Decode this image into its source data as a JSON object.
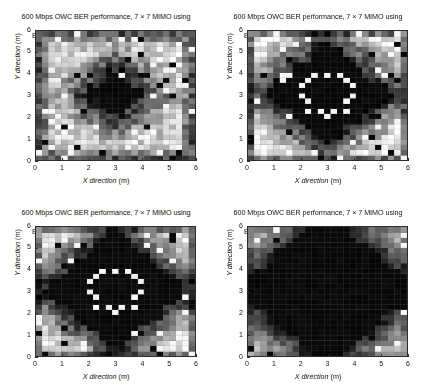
{
  "figure": {
    "background": "#ffffff",
    "layout": "2x2 subplot grid",
    "axis_color": "#2b2b2b"
  },
  "axes_common": {
    "xlabel_text": "X direction",
    "xlabel_unit": " (m)",
    "ylabel_text": "Y direction",
    "ylabel_unit": " (m)",
    "xticks": [
      "0",
      "1",
      "2",
      "3",
      "4",
      "5",
      "6"
    ],
    "yticks": [
      "0",
      "1",
      "2",
      "3",
      "4",
      "5",
      "6"
    ],
    "xlim": [
      0,
      6
    ],
    "ylim": [
      0,
      6
    ],
    "grid": true,
    "colormap": "gray"
  },
  "panels": [
    {
      "id": "panel-top-left",
      "title_line1": "600 Mbps OWC BER performance, 7 × 7 MIMO using",
      "title_line2": "EGC (−87 dBmW noise), BER outage: 0.87515",
      "noise_dbmw": -87,
      "ber_outage": 0.87515,
      "combining": "EGC",
      "mimo": "7 × 7",
      "data_rate": "600 Mbps"
    },
    {
      "id": "panel-top-right",
      "title_line1": "600 Mbps OWC BER performance, 7 × 7 MIMO using",
      "title_line2": "EGC (−90 dBmW noise), BER outage: 0.53746",
      "noise_dbmw": -90,
      "ber_outage": 0.53746,
      "combining": "EGC",
      "mimo": "7 × 7",
      "data_rate": "600 Mbps"
    },
    {
      "id": "panel-bottom-left",
      "title_line1": "600 Mbps OWC BER performance, 7 × 7 MIMO using",
      "title_line2": "EGC (−93 dBmW noise), BER outage: 0.46136",
      "noise_dbmw": -93,
      "ber_outage": 0.46136,
      "combining": "EGC",
      "mimo": "7 × 7",
      "data_rate": "600 Mbps"
    },
    {
      "id": "panel-bottom-right",
      "title_line1": "600 Mbps OWC BER performance, 7 × 7 MIMO using",
      "title_line2": "EGC (−96 dBmW noise), BER outage: 0.24732",
      "noise_dbmw": -96,
      "ber_outage": 0.24732,
      "combining": "EGC",
      "mimo": "7 × 7",
      "data_rate": "600 Mbps"
    }
  ],
  "chart_data": [
    {
      "type": "heatmap",
      "panel": "panel-top-left",
      "title": "600 Mbps OWC BER performance, 7 × 7 MIMO using EGC (−87 dBmW noise), BER outage: 0.87515",
      "xlabel": "X direction (m)",
      "ylabel": "Y direction (m)",
      "xlim": [
        0,
        6
      ],
      "ylim": [
        0,
        6
      ],
      "grid": true,
      "nx": 25,
      "ny": 25,
      "colormap": "gray",
      "value_range": [
        0,
        1
      ],
      "legend": "none",
      "annotations": [],
      "description": "Mostly mid-to-light grey field with a large solid black elliptical region at room centre (approx x 2.3-3.9 m, y 2.2-4.0 m) and dark borders at the room edges; scattered isolated black cells form a loose ring at radius ~1.8 m from centre.",
      "pattern": {
        "center": [
          3.0,
          3.1
        ],
        "core_radius_m": 0.85,
        "edge_dark_width_m": 0.55,
        "base_level": 0.72,
        "noise_amplitude": 0.2,
        "speckle_density": 0.09
      }
    },
    {
      "type": "heatmap",
      "panel": "panel-top-right",
      "title": "600 Mbps OWC BER performance, 7 × 7 MIMO using EGC (−90 dBmW noise), BER outage: 0.53746",
      "xlabel": "X direction (m)",
      "ylabel": "Y direction (m)",
      "xlim": [
        0,
        6
      ],
      "ylim": [
        0,
        6
      ],
      "grid": true,
      "nx": 25,
      "ny": 25,
      "colormap": "gray",
      "value_range": [
        0,
        1
      ],
      "legend": "none",
      "annotations": [],
      "description": "Large black star/flower shaped region covering the room centre, containing a distinct ring of isolated white cells at radius ~0.9 m about the centre; light grey cells remain in the four corners and along edge midpoints.",
      "pattern": {
        "center": [
          3.0,
          3.1
        ],
        "core_radius_m": 1.85,
        "edge_dark_width_m": 0.3,
        "base_level": 0.8,
        "noise_amplitude": 0.18,
        "speckle_density": 0.1,
        "white_ring_radius_m": 0.95
      }
    },
    {
      "type": "heatmap",
      "panel": "panel-bottom-left",
      "title": "600 Mbps OWC BER performance, 7 × 7 MIMO using EGC (−93 dBmW noise), BER outage: 0.46136",
      "xlabel": "X direction (m)",
      "ylabel": "Y direction (m)",
      "xlim": [
        0,
        6
      ],
      "ylim": [
        0,
        6
      ],
      "grid": true,
      "nx": 25,
      "ny": 25,
      "colormap": "gray",
      "value_range": [
        0,
        1
      ],
      "legend": "none",
      "annotations": [],
      "description": "Black region expanded further than the -90 dBmW case, a thin white dotted ring of radius ~0.9 m persists around the centre; light grey confined to the outer frame, strongest in the corners.",
      "pattern": {
        "center": [
          3.0,
          3.1
        ],
        "core_radius_m": 2.15,
        "edge_dark_width_m": 0.25,
        "base_level": 0.82,
        "noise_amplitude": 0.16,
        "speckle_density": 0.09,
        "white_ring_radius_m": 0.95
      }
    },
    {
      "type": "heatmap",
      "panel": "panel-bottom-right",
      "title": "600 Mbps OWC BER performance, 7 × 7 MIMO using EGC (−96 dBmW noise), BER outage: 0.24732",
      "xlabel": "X direction (m)",
      "ylabel": "Y direction (m)",
      "xlim": [
        0,
        6
      ],
      "ylim": [
        0,
        6
      ],
      "grid": true,
      "nx": 25,
      "ny": 25,
      "colormap": "gray",
      "value_range": [
        0,
        1
      ],
      "legend": "none",
      "annotations": [],
      "description": "Almost entirely black field; only the four corner regions and a few scattered single cells retain light grey or white values.",
      "pattern": {
        "center": [
          3.0,
          3.1
        ],
        "core_radius_m": 2.85,
        "edge_dark_width_m": 0.15,
        "base_level": 0.85,
        "noise_amplitude": 0.12,
        "speckle_density": 0.05
      }
    }
  ]
}
